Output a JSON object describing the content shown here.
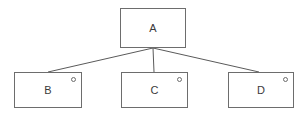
{
  "diagram": {
    "type": "tree",
    "title": "",
    "canvas": {
      "width": 307,
      "height": 120,
      "background": "#ffffff"
    },
    "style": {
      "stroke": "#6d6d6d",
      "edge_stroke": "#5a5a5a",
      "text_color": "#3a3a3a",
      "node_fill": "#ffffff"
    },
    "nodes": [
      {
        "id": "A",
        "label": "A",
        "x": 120,
        "y": 8,
        "width": 66,
        "height": 40,
        "marker": false,
        "marker_label": ""
      },
      {
        "id": "B",
        "label": "B",
        "x": 14,
        "y": 72,
        "width": 68,
        "height": 36,
        "marker": true,
        "marker_label": "o"
      },
      {
        "id": "C",
        "label": "C",
        "x": 121,
        "y": 72,
        "width": 67,
        "height": 36,
        "marker": true,
        "marker_label": "o"
      },
      {
        "id": "D",
        "label": "D",
        "x": 228,
        "y": 72,
        "width": 66,
        "height": 36,
        "marker": true,
        "marker_label": "o"
      }
    ],
    "edges": [
      {
        "id": "edge-a-b",
        "from": "A",
        "to": "B",
        "x1": 153,
        "y1": 48,
        "x2": 48,
        "y2": 72
      },
      {
        "id": "edge-a-c",
        "from": "A",
        "to": "C",
        "x1": 153,
        "y1": 48,
        "x2": 154,
        "y2": 72
      },
      {
        "id": "edge-a-d",
        "from": "A",
        "to": "D",
        "x1": 153,
        "y1": 48,
        "x2": 259,
        "y2": 72
      }
    ]
  }
}
